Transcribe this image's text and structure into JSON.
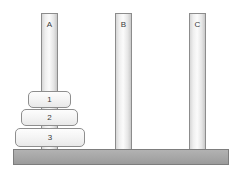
{
  "scene": {
    "title": "Tower of Hanoi",
    "width": 242,
    "height": 173,
    "background_color": "#ffffff"
  },
  "base": {
    "name": "base-bar",
    "color": "#a6a6a6",
    "border_color": "#7d7d7d",
    "x": 13,
    "y": 149,
    "width": 216,
    "height": 16
  },
  "pegs": [
    {
      "label": "A",
      "x": 41,
      "y": 13,
      "width": 17,
      "height": 137,
      "color": "#efefef",
      "border_color": "#8c8c8c"
    },
    {
      "label": "B",
      "x": 115,
      "y": 13,
      "width": 17,
      "height": 137,
      "color": "#efefef",
      "border_color": "#8c8c8c"
    },
    {
      "label": "C",
      "x": 189,
      "y": 13,
      "width": 17,
      "height": 137,
      "color": "#efefef",
      "border_color": "#8c8c8c"
    }
  ],
  "disks": [
    {
      "label": "1",
      "size": 1,
      "peg": "A",
      "x": 28,
      "y": 91,
      "width": 43,
      "height": 17,
      "color": "#f4f4f4",
      "border_color": "#8e8e8e"
    },
    {
      "label": "2",
      "size": 2,
      "peg": "A",
      "x": 21,
      "y": 109,
      "width": 57,
      "height": 17,
      "color": "#f4f4f4",
      "border_color": "#8e8e8e"
    },
    {
      "label": "3",
      "size": 3,
      "peg": "A",
      "x": 15,
      "y": 128,
      "width": 70,
      "height": 19,
      "color": "#f4f4f4",
      "border_color": "#8e8e8e"
    }
  ],
  "state": {
    "A": [
      "1",
      "2",
      "3"
    ],
    "B": [],
    "C": []
  }
}
